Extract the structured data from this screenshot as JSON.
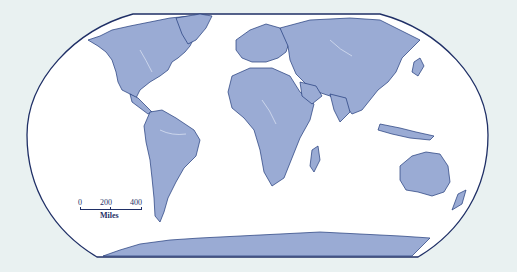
{
  "map": {
    "type": "world-political-outline",
    "projection": "Robinson",
    "colors": {
      "background": "#e9f1f1",
      "ocean": "#ffffff",
      "land": "#9aabd4",
      "border": "#1f3a7a",
      "rivers": "#dfe6f5",
      "frame": "#1f2f66"
    },
    "continents": [
      "North America",
      "South America",
      "Europe",
      "Africa",
      "Asia",
      "Australia",
      "Antarctica"
    ]
  },
  "scale_bar": {
    "ticks": [
      "0",
      "200",
      "400"
    ],
    "unit": "Miles"
  }
}
